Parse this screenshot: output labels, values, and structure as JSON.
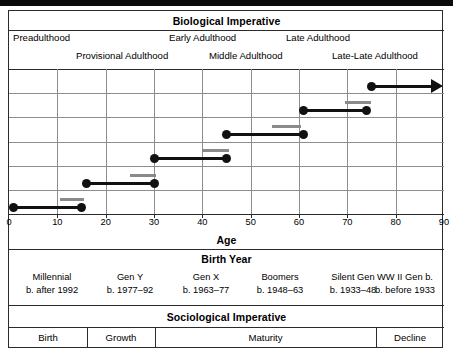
{
  "figure": {
    "biological_header": "Biological Imperative",
    "axis_title": "Age",
    "birth_year_header": "Birth Year",
    "sociological_header": "Sociological Imperative"
  },
  "stages_upper": [
    {
      "label": "Preadulthood",
      "x": 4
    },
    {
      "label": "Early Adulthood",
      "x": 160
    },
    {
      "label": "Late Adulthood",
      "x": 277
    }
  ],
  "stages_lower": [
    {
      "label": "Provisional Adulthood",
      "x": 67
    },
    {
      "label": "Middle Adulthood",
      "x": 200
    },
    {
      "label": "Late-Late Adulthood",
      "x": 323
    }
  ],
  "generations": [
    {
      "name": "Millennial",
      "birth": "b. after 1992",
      "x": 4,
      "w": 78
    },
    {
      "name": "Gen Y",
      "birth": "b. 1977‒92",
      "x": 82,
      "w": 78
    },
    {
      "name": "Gen X",
      "birth": "b. 1963‒77",
      "x": 158,
      "w": 78
    },
    {
      "name": "Boomers",
      "birth": "b. 1948‒63",
      "x": 232,
      "w": 78
    },
    {
      "name": "Silent Gen",
      "birth": "b. 1933‒48",
      "x": 305,
      "w": 78
    },
    {
      "name": "WW II Gen b.",
      "birth": "b. before 1933",
      "x": 357,
      "w": 78
    }
  ],
  "socio_stages": [
    {
      "label": "Birth",
      "x": 0,
      "w": 78
    },
    {
      "label": "Growth",
      "x": 78,
      "w": 68
    },
    {
      "label": "Maturity",
      "x": 146,
      "w": 221
    },
    {
      "label": "Decline",
      "x": 367,
      "w": 68
    }
  ],
  "chart_data": {
    "type": "bar",
    "title": "Biological Imperative",
    "xlabel": "Age",
    "ylabel": "",
    "xlim": [
      0,
      90
    ],
    "xticks": [
      0,
      10,
      20,
      30,
      40,
      50,
      60,
      70,
      80,
      90
    ],
    "grid": true,
    "legend": null,
    "note": "Horizontal age-span bars (black, dot-capped) for six generational cohorts; gray bars mark the upper transition sub-span of each cohort. Top row extends with an open arrow (ongoing).",
    "series": [
      {
        "name": "WW II Gen b. before 1933",
        "row": 0,
        "start": 75,
        "end": 90,
        "open_ended": true,
        "gray_start": null,
        "gray_end": null
      },
      {
        "name": "Silent Gen b. 1933‒48",
        "row": 1,
        "start": 61,
        "end": 74,
        "open_ended": false,
        "gray_start": 69.5,
        "gray_end": 75
      },
      {
        "name": "Boomers b. 1948‒63",
        "row": 2,
        "start": 45,
        "end": 61,
        "open_ended": false,
        "gray_start": 54.5,
        "gray_end": 60.5
      },
      {
        "name": "Gen X b. 1963‒77",
        "row": 3,
        "start": 30,
        "end": 45,
        "open_ended": false,
        "gray_start": 40,
        "gray_end": 45.5
      },
      {
        "name": "Gen Y b. 1977‒92",
        "row": 4,
        "start": 16,
        "end": 30,
        "open_ended": false,
        "gray_start": 25,
        "gray_end": 30.5
      },
      {
        "name": "Millennial b. after 1992",
        "row": 5,
        "start": 1,
        "end": 15,
        "open_ended": false,
        "gray_start": 10.5,
        "gray_end": 15.5
      }
    ]
  },
  "colors": {
    "bar": "#111111",
    "gray_bar": "#8a8a8a",
    "grid": "#8d8d8d",
    "frame": "#2b2b2b",
    "background": "#ffffff"
  }
}
